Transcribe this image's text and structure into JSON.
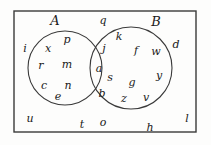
{
  "figure": {
    "type": "venn-diagram",
    "stroke_color": "#3a3a3a",
    "text_color": "#1a1a1a",
    "background_color": "#fdfdfc"
  },
  "universe": {
    "name": "universal-set-rectangle",
    "x": 14,
    "y": 11,
    "width": 182,
    "height": 121
  },
  "circles": [
    {
      "name": "circle-A",
      "label": "A",
      "cx": 65,
      "cy": 68,
      "r": 37
    },
    {
      "name": "circle-B",
      "label": "B",
      "cx": 131,
      "cy": 68,
      "r": 41
    }
  ],
  "set_labels": [
    {
      "name": "set-label-A",
      "text": "A",
      "x": 55,
      "y": 20
    },
    {
      "name": "set-label-B",
      "text": "B",
      "x": 156,
      "y": 21
    }
  ],
  "elements": {
    "only_a": [
      {
        "text": "p",
        "x": 67,
        "y": 39
      },
      {
        "text": "x",
        "x": 48,
        "y": 48
      },
      {
        "text": "r",
        "x": 41,
        "y": 65
      },
      {
        "text": "m",
        "x": 67,
        "y": 64
      },
      {
        "text": "c",
        "x": 44,
        "y": 85
      },
      {
        "text": "n",
        "x": 68,
        "y": 85
      },
      {
        "text": "e",
        "x": 58,
        "y": 96
      }
    ],
    "intersection": [
      {
        "text": "j",
        "x": 104,
        "y": 48
      },
      {
        "text": "a",
        "x": 99,
        "y": 68
      },
      {
        "text": "s",
        "x": 110,
        "y": 77
      },
      {
        "text": "b",
        "x": 102,
        "y": 93
      }
    ],
    "only_b": [
      {
        "text": "k",
        "x": 119,
        "y": 36
      },
      {
        "text": "f",
        "x": 136,
        "y": 50
      },
      {
        "text": "w",
        "x": 156,
        "y": 51
      },
      {
        "text": "g",
        "x": 132,
        "y": 82
      },
      {
        "text": "y",
        "x": 159,
        "y": 75
      },
      {
        "text": "z",
        "x": 124,
        "y": 98
      },
      {
        "text": "v",
        "x": 146,
        "y": 97
      }
    ],
    "outside": [
      {
        "text": "q",
        "x": 103,
        "y": 20
      },
      {
        "text": "i",
        "x": 25,
        "y": 48
      },
      {
        "text": "d",
        "x": 176,
        "y": 44
      },
      {
        "text": "u",
        "x": 30,
        "y": 118
      },
      {
        "text": "t",
        "x": 82,
        "y": 124
      },
      {
        "text": "o",
        "x": 103,
        "y": 122
      },
      {
        "text": "h",
        "x": 150,
        "y": 127
      },
      {
        "text": "l",
        "x": 187,
        "y": 118
      }
    ]
  }
}
